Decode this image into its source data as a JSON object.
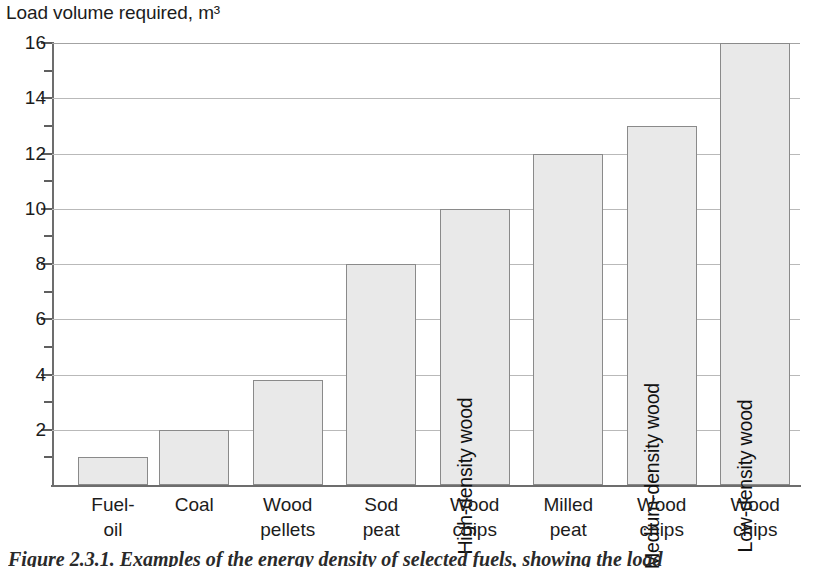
{
  "chart_data": {
    "type": "bar",
    "title": "Load volume required, m³",
    "xlabel": "",
    "ylabel": "Load volume required, m³",
    "ylim": [
      0,
      16
    ],
    "ytick_step": 2,
    "minor_tick_step": 1,
    "grid": "horizontal-major",
    "legend": "none",
    "categories": [
      "Fuel-oil",
      "Coal",
      "Wood pellets",
      "Sod peat",
      "Wood chips",
      "Milled peat",
      "Wood chips",
      "Wood chips"
    ],
    "values": [
      1,
      2,
      3.8,
      8,
      10,
      12,
      13,
      16
    ],
    "ytick_labels": [
      "2",
      "4",
      "6",
      "8",
      "10",
      "12",
      "14",
      "16"
    ],
    "ytick_values": [
      2,
      4,
      6,
      8,
      10,
      12,
      14,
      16
    ],
    "bar_color": "#e9e9e9",
    "bar_edge_color": "#8a8a8a",
    "grid_color": "#b9b9b9",
    "axis_color": "#6d6d6d",
    "annotations": [
      {
        "bar_index": 4,
        "text": "High-density wood",
        "rotation": 90
      },
      {
        "bar_index": 6,
        "text": "Medium-density wood",
        "rotation": 90
      },
      {
        "bar_index": 7,
        "text": "Low-density wood",
        "rotation": 90
      }
    ]
  },
  "axis": {
    "ticks": [
      {
        "value": 16,
        "label": "16",
        "major": true
      },
      {
        "value": 15,
        "label": "",
        "major": false
      },
      {
        "value": 14,
        "label": "14",
        "major": true
      },
      {
        "value": 13,
        "label": "",
        "major": false
      },
      {
        "value": 12,
        "label": "12",
        "major": true
      },
      {
        "value": 11,
        "label": "",
        "major": false
      },
      {
        "value": 10,
        "label": "10",
        "major": true
      },
      {
        "value": 9,
        "label": "",
        "major": false
      },
      {
        "value": 8,
        "label": "8",
        "major": true
      },
      {
        "value": 7,
        "label": "",
        "major": false
      },
      {
        "value": 6,
        "label": "6",
        "major": true
      },
      {
        "value": 5,
        "label": "",
        "major": false
      },
      {
        "value": 4,
        "label": "4",
        "major": true
      },
      {
        "value": 3,
        "label": "",
        "major": false
      },
      {
        "value": 2,
        "label": "2",
        "major": true
      },
      {
        "value": 1,
        "label": "",
        "major": false
      }
    ]
  },
  "bars": [
    {
      "label_line1": "Fuel-",
      "label_line2": "oil",
      "value": 1,
      "inner_label": ""
    },
    {
      "label_line1": "Coal",
      "label_line2": "",
      "value": 2,
      "inner_label": ""
    },
    {
      "label_line1": "Wood",
      "label_line2": "pellets",
      "value": 3.8,
      "inner_label": ""
    },
    {
      "label_line1": "Sod",
      "label_line2": "peat",
      "value": 8,
      "inner_label": ""
    },
    {
      "label_line1": "Wood",
      "label_line2": "chips",
      "value": 10,
      "inner_label": "High-density wood"
    },
    {
      "label_line1": "Milled",
      "label_line2": "peat",
      "value": 12,
      "inner_label": ""
    },
    {
      "label_line1": "Wood",
      "label_line2": "chips",
      "value": 13,
      "inner_label": "Medium-density wood"
    },
    {
      "label_line1": "Wood",
      "label_line2": "chips",
      "value": 16,
      "inner_label": "Low-density wood"
    }
  ],
  "caption": {
    "text": "Figure 2.3.1. Examples of the energy density of selected fuels, showing the load"
  }
}
